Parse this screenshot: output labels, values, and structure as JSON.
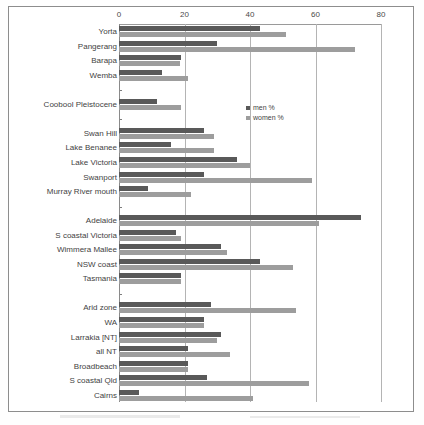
{
  "chart_data": {
    "type": "bar",
    "orientation": "horizontal",
    "title": "",
    "xlabel": "",
    "ylabel": "",
    "xlim": [
      0,
      80
    ],
    "xticks": [
      0,
      20,
      40,
      60,
      80
    ],
    "grid": true,
    "legend_position": "center",
    "legend": [
      "men %",
      "women %"
    ],
    "categories": [
      "Yorta",
      "Pangerang",
      "Barapa",
      "Wemba",
      "",
      "Coobool Pleistocene",
      "",
      "Swan Hill",
      "Lake Benanee",
      "Lake Victoria",
      "Swanport",
      "Murray River mouth",
      "",
      "Adelaide",
      "S coastal Victoria",
      "Wimmera Mallee",
      "NSW coast",
      "Tasmania",
      "",
      "Arid zone",
      "WA",
      "Larrakia [NT]",
      "all NT",
      "Broadbeach",
      "S coastal Qld",
      "Cairns"
    ],
    "series": [
      {
        "name": "men %",
        "color": "#595959",
        "values": [
          43,
          30,
          19,
          13,
          null,
          11.5,
          null,
          26,
          16,
          36,
          26,
          9,
          null,
          74,
          17.5,
          31,
          43,
          19,
          null,
          28,
          26,
          31,
          21,
          21,
          27,
          6
        ]
      },
      {
        "name": "women %",
        "color": "#9d9d9d",
        "values": [
          51,
          72,
          18.5,
          21,
          null,
          19,
          null,
          29,
          29,
          40,
          59,
          22,
          null,
          61,
          19,
          33,
          53,
          19,
          null,
          54,
          26,
          30,
          34,
          21,
          58,
          41
        ]
      }
    ]
  },
  "axis": {
    "tick_labels": [
      "0",
      "20",
      "40",
      "60",
      "80"
    ]
  },
  "legend": {
    "items": [
      {
        "label": "men %",
        "key": "men"
      },
      {
        "label": "women %",
        "key": "women"
      }
    ]
  }
}
